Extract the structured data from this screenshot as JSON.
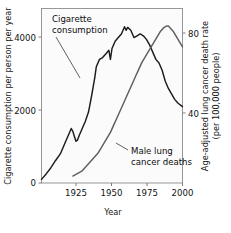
{
  "chart_data": {
    "type": "line",
    "title": "",
    "xlabel": "Year",
    "ylabel": "Cigarette consumption per person per year",
    "ylabel_right_line1": "Age-adjusted lung cancer death rate",
    "ylabel_right_line2": "(per 100,000 people)",
    "xlim": [
      1910,
      2000
    ],
    "ylim_left": [
      0,
      4800
    ],
    "ylim_right": [
      0,
      100
    ],
    "xticks": [
      1925,
      1950,
      1975,
      2000
    ],
    "xtick_labels": [
      "1925",
      "1950",
      "1975",
      "2000"
    ],
    "yticks_left": [
      0,
      2000,
      4000
    ],
    "ytick_labels_left": [
      "0",
      "2000",
      "4000"
    ],
    "yticks_right": [
      40,
      80
    ],
    "ytick_labels_right": [
      "40",
      "80"
    ],
    "grid": false,
    "legend_position": "inline-annotations",
    "annotations": [
      {
        "name": "cigarette-consumption-label",
        "line1": "Cigarette",
        "line2": "consumption"
      },
      {
        "name": "male-lung-cancer-label",
        "line1": "Male lung",
        "line2": "cancer deaths"
      }
    ],
    "series": [
      {
        "name": "Cigarette consumption",
        "axis": "left",
        "units": "cigarettes per person per year",
        "x": [
          1910,
          1913,
          1916,
          1919,
          1922,
          1925,
          1927,
          1929,
          1930,
          1931,
          1932,
          1933,
          1934,
          1936,
          1938,
          1940,
          1942,
          1944,
          1945,
          1947,
          1949,
          1951,
          1953,
          1954,
          1955,
          1957,
          1959,
          1961,
          1963,
          1964,
          1965,
          1967,
          1969,
          1971,
          1973,
          1975,
          1977,
          1979,
          1981,
          1983,
          1985,
          1987,
          1989,
          1991,
          1993,
          1995,
          1997,
          2000
        ],
        "values": [
          100,
          250,
          420,
          620,
          800,
          1100,
          1300,
          1500,
          1420,
          1280,
          1150,
          1180,
          1300,
          1500,
          1700,
          1950,
          2400,
          2900,
          3200,
          3400,
          3450,
          3550,
          3650,
          3400,
          3700,
          3900,
          4000,
          4100,
          4300,
          4200,
          4280,
          4200,
          4000,
          4050,
          4100,
          4050,
          3950,
          3800,
          3600,
          3400,
          3300,
          3100,
          2800,
          2600,
          2450,
          2300,
          2200,
          2100
        ]
      },
      {
        "name": "Male lung cancer deaths",
        "axis": "right",
        "units": "deaths per 100,000 people",
        "x": [
          1930,
          1932,
          1934,
          1936,
          1938,
          1940,
          1942,
          1944,
          1946,
          1948,
          1950,
          1952,
          1954,
          1956,
          1958,
          1960,
          1962,
          1964,
          1966,
          1968,
          1970,
          1972,
          1974,
          1976,
          1978,
          1980,
          1982,
          1984,
          1986,
          1988,
          1990,
          1991,
          1992,
          1994,
          1996,
          1998,
          2000
        ],
        "values": [
          4,
          5,
          6,
          7,
          9,
          11,
          13,
          15,
          17,
          20,
          23,
          26,
          29,
          33,
          37,
          41,
          45,
          49,
          53,
          57,
          61,
          65,
          69,
          72,
          75,
          78,
          81,
          84,
          87,
          89,
          90,
          90,
          89,
          87,
          84,
          81,
          78
        ]
      }
    ]
  }
}
